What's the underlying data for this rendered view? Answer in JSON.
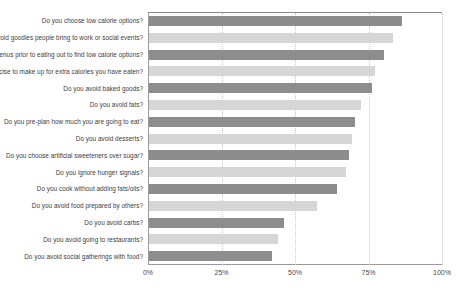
{
  "chart_data": {
    "type": "bar",
    "orientation": "horizontal",
    "title": "",
    "subtitle": "",
    "xlabel": "",
    "ylabel": "",
    "xlim": [
      0,
      100
    ],
    "xtick_labels": [
      "0%",
      "25%",
      "50%",
      "75%",
      "100%"
    ],
    "xticks": [
      0,
      25,
      50,
      75,
      100
    ],
    "grid": "vertical-dotted",
    "legend": "none",
    "value_suffix": "%",
    "colors": {
      "bar_dark": "#8d8d8d",
      "bar_light": "#d6d6d6",
      "axis": "#9a9a9a",
      "gridline": "#c9c9c9",
      "text": "#3d3d3d",
      "background": "#ffffff"
    },
    "categories": [
      "Do you choose low calorie options?",
      "Do you avoid goodies people bring to work or social events?",
      "Do you look at menus prior to eating out to find low calorie options?",
      "Do you exercise to make up for extra calories you have eaten?",
      "Do you avoid baked goods?",
      "Do you avoid fats?",
      "Do you pre-plan how much you are going to eat?",
      "Do you avoid desserts?",
      "Do you choose artificial sweeteners over sugar?",
      "Do you ignore hunger signals?",
      "Do you cook without adding fats/oils?",
      "Do you avoid food prepared by others?",
      "Do you avoid carbs?",
      "Do you avoid going to restaurants?",
      "Do you avoid social gatherings with food?"
    ],
    "values": [
      86,
      83,
      80,
      77,
      76,
      72,
      70,
      69,
      68,
      67,
      64,
      57,
      46,
      44,
      42
    ]
  }
}
